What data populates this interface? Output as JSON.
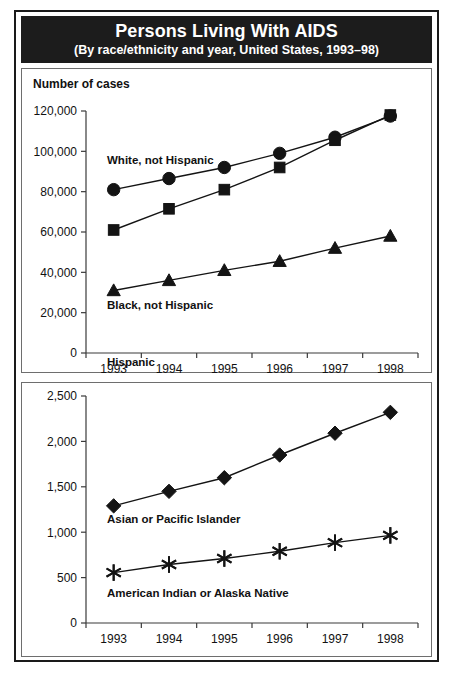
{
  "title": {
    "main": "Persons Living With AIDS",
    "sub": "(By race/ethnicity and year, United States, 1993–98)"
  },
  "colors": {
    "banner_background": "#1c1c1c",
    "banner_text": "#ffffff",
    "frame": "#1a1a1a",
    "panel_border": "#6e6e6e",
    "ink": "#141414",
    "background": "#ffffff"
  },
  "top_chart": {
    "axis_title": "Number of cases",
    "y_ticks": [
      "0",
      "20,000",
      "40,000",
      "60,000",
      "80,000",
      "100,000",
      "120,000"
    ],
    "x_ticks": [
      "1993",
      "1994",
      "1995",
      "1996",
      "1997",
      "1998"
    ],
    "labels": {
      "white": "White, not Hispanic",
      "black": "Black, not Hispanic",
      "hispanic": "Hispanic"
    }
  },
  "bottom_chart": {
    "y_ticks": [
      "0",
      "500",
      "1,000",
      "1,500",
      "2,000",
      "2,500"
    ],
    "x_ticks": [
      "1993",
      "1994",
      "1995",
      "1996",
      "1997",
      "1998"
    ],
    "labels": {
      "asian": "Asian or Pacific Islander",
      "amind": "American Indian or Alaska Native"
    }
  },
  "chart_data": [
    {
      "type": "line",
      "title": "Persons Living With AIDS",
      "subtitle": "(By race/ethnicity and year, United States, 1993–98)",
      "panel": "top",
      "xlabel": "",
      "ylabel": "Number of cases",
      "categories": [
        1993,
        1994,
        1995,
        1996,
        1997,
        1998
      ],
      "xlim": [
        1993,
        1998
      ],
      "ylim": [
        0,
        120000
      ],
      "ytick_values": [
        0,
        20000,
        40000,
        60000,
        80000,
        100000,
        120000
      ],
      "ytick_labels": [
        "0",
        "20,000",
        "40,000",
        "60,000",
        "80,000",
        "100,000",
        "120,000"
      ],
      "xtick_labels": [
        "1993",
        "1994",
        "1995",
        "1996",
        "1997",
        "1998"
      ],
      "grid": false,
      "legend": "inline-annotations",
      "series": [
        {
          "name": "White, not Hispanic",
          "marker": "circle",
          "values": [
            81000,
            86500,
            92000,
            99000,
            107000,
            117500
          ]
        },
        {
          "name": "Black, not Hispanic",
          "marker": "square",
          "values": [
            61000,
            71500,
            81000,
            92000,
            105500,
            118000
          ]
        },
        {
          "name": "Hispanic",
          "marker": "triangle",
          "values": [
            31000,
            36000,
            41000,
            45500,
            52000,
            58000
          ]
        }
      ]
    },
    {
      "type": "line",
      "panel": "bottom",
      "xlabel": "",
      "ylabel": "",
      "categories": [
        1993,
        1994,
        1995,
        1996,
        1997,
        1998
      ],
      "xlim": [
        1993,
        1998
      ],
      "ylim": [
        0,
        2500
      ],
      "ytick_values": [
        0,
        500,
        1000,
        1500,
        2000,
        2500
      ],
      "ytick_labels": [
        "0",
        "500",
        "1,000",
        "1,500",
        "2,000",
        "2,500"
      ],
      "xtick_labels": [
        "1993",
        "1994",
        "1995",
        "1996",
        "1997",
        "1998"
      ],
      "grid": false,
      "legend": "inline-annotations",
      "series": [
        {
          "name": "Asian or Pacific Islander",
          "marker": "diamond",
          "values": [
            1290,
            1450,
            1600,
            1850,
            2090,
            2320
          ]
        },
        {
          "name": "American Indian or Alaska Native",
          "marker": "star",
          "values": [
            555,
            645,
            710,
            790,
            885,
            965
          ]
        }
      ]
    }
  ]
}
